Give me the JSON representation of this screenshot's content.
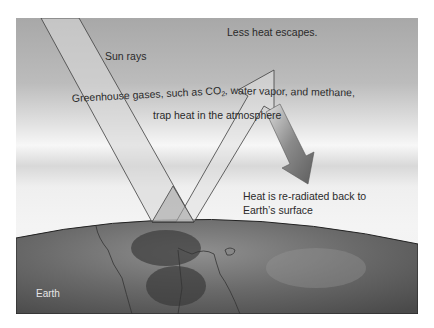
{
  "diagram": {
    "labels": {
      "sun_rays": "Sun rays",
      "less_heat": "Less heat escapes.",
      "greenhouse_line1_pre": "Greenhouse gases, such as CO",
      "greenhouse_line1_sub": "2",
      "greenhouse_line1_post": ", water vapor, and methane,",
      "greenhouse_line2": "trap heat in the atmosphere",
      "reradiated_line1": "Heat is re-radiated back to",
      "reradiated_line2": "Earth’s surface",
      "earth": "Earth"
    },
    "colors": {
      "sky_top": "#a9a9a9",
      "atmosphere_band": "#f2f2f2",
      "beam_fill": "#d6d6d6",
      "beam_stroke": "#4a4a4a",
      "heat_arrow": "#6f6f6f",
      "earth_dark": "#4d4d4d",
      "earth_light": "#8a8a8a"
    }
  }
}
